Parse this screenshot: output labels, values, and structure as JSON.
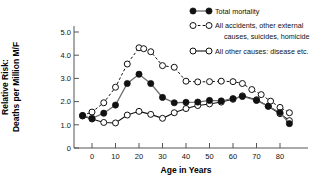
{
  "chart_data": {
    "type": "line",
    "title": "",
    "xlabel": "Age in Years",
    "ylabel": "Relative Risk:\nDeaths per Million M/F",
    "ylabel_line1": "Relative Risk:",
    "ylabel_line2": "Deaths per Million M/F",
    "xlim": [
      -6,
      90
    ],
    "ylim": [
      0,
      5.4
    ],
    "xticks": [
      0,
      10,
      20,
      30,
      40,
      50,
      60,
      70,
      80
    ],
    "xticklabels": [
      "0",
      "10",
      "20",
      "30",
      "40",
      "50",
      "60",
      "70",
      "80"
    ],
    "yticks": [
      0,
      1.0,
      2.0,
      3.0,
      4.0,
      5.0
    ],
    "yticklabels": [
      "0",
      "1.0",
      "2.0",
      "3.0",
      "4.0",
      "5.0"
    ],
    "grid": false,
    "legend_position": "top-right",
    "series": [
      {
        "name": "Total mortality",
        "marker": "filled-circle",
        "linestyle": "solid",
        "color": "#111111",
        "line_color": "#6f6f6f",
        "x": [
          -4,
          0,
          5,
          10,
          15,
          20,
          25,
          30,
          35,
          40,
          45,
          50,
          55,
          60,
          64,
          70,
          75,
          80,
          84
        ],
        "y": [
          1.4,
          1.28,
          1.5,
          1.85,
          2.78,
          3.18,
          2.78,
          2.18,
          1.95,
          1.97,
          1.98,
          2.05,
          2.03,
          2.13,
          2.22,
          2.05,
          1.8,
          1.53,
          1.05
        ]
      },
      {
        "name": "All accidents, other external causes, suicides, homicide",
        "name_line1": "All accidents, other external",
        "name_line2": "causes, suicides, homicide",
        "marker": "open-circle",
        "linestyle": "dashed",
        "color": "#111111",
        "x": [
          -4,
          0,
          5,
          10,
          15,
          20,
          22,
          25,
          30,
          35,
          40,
          45,
          50,
          55,
          60,
          64,
          68,
          72,
          76,
          80,
          84
        ],
        "y": [
          1.4,
          1.55,
          1.95,
          2.62,
          3.62,
          4.32,
          4.28,
          4.15,
          3.55,
          3.48,
          2.88,
          2.85,
          2.86,
          2.88,
          2.86,
          2.78,
          2.52,
          2.3,
          2.02,
          1.75,
          1.52
        ]
      },
      {
        "name": "All other causes: disease etc.",
        "marker": "open-circle",
        "linestyle": "solid",
        "color": "#111111",
        "x": [
          -4,
          0,
          5,
          10,
          15,
          20,
          25,
          30,
          35,
          40,
          45,
          50,
          55,
          60,
          64,
          70,
          75,
          80,
          84
        ],
        "y": [
          1.38,
          1.25,
          1.1,
          1.08,
          1.42,
          1.58,
          1.45,
          1.28,
          1.52,
          1.7,
          1.83,
          1.9,
          1.98,
          2.1,
          2.25,
          2.08,
          1.8,
          1.48,
          1.18
        ]
      }
    ]
  },
  "legend": {
    "items": [
      {
        "label": "Total mortality",
        "marker": "filled-circle",
        "linestyle": "solid"
      },
      {
        "label": "All accidents, other external",
        "label2": "causes, suicides, homicide",
        "marker": "open-circle",
        "linestyle": "dashed"
      },
      {
        "label": "All other causes: disease etc.",
        "marker": "open-circle",
        "linestyle": "solid"
      }
    ]
  }
}
